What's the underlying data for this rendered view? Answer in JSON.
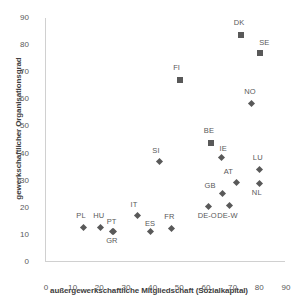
{
  "chart_data": {
    "type": "scatter",
    "title": "",
    "xlabel": "außergewerkschaftliche Mitgliedschaft (Sozialkapital)",
    "ylabel": "gewerkschaftlicher Organisationsgrad",
    "xlim": [
      0,
      90
    ],
    "ylim": [
      0,
      90
    ],
    "xticks": [
      "0",
      "10",
      "20",
      "30",
      "40",
      "50",
      "60",
      "70",
      "80",
      "90"
    ],
    "yticks": [
      "0",
      "10",
      "20",
      "30",
      "40",
      "50",
      "60",
      "70",
      "80",
      "90"
    ],
    "grid": false,
    "legend": "none",
    "marker_color": "#595959",
    "points": [
      {
        "label": "PL",
        "x": 14.0,
        "y": 12.8,
        "marker": "diamond",
        "label_dx": -1,
        "label_dy": -13
      },
      {
        "label": "HU",
        "x": 20.3,
        "y": 12.8,
        "marker": "diamond",
        "label_dx": -1,
        "label_dy": -13
      },
      {
        "label": "PT",
        "x": 24.8,
        "y": 11.4,
        "marker": "diamond",
        "label_dx": 0.5,
        "label_dy": -11
      },
      {
        "label": "GR",
        "x": 25.2,
        "y": 11.2,
        "marker": "diamond",
        "label_dx": -1,
        "label_dy": 7
      },
      {
        "label": "IT",
        "x": 34.3,
        "y": 17.0,
        "marker": "diamond",
        "label_dx": -1,
        "label_dy": -13
      },
      {
        "label": "ES",
        "x": 39.0,
        "y": 11.1,
        "marker": "diamond",
        "label_dx": 1,
        "label_dy": -10
      },
      {
        "label": "FR",
        "x": 47.0,
        "y": 12.4,
        "marker": "diamond",
        "label_dx": -1,
        "label_dy": -13
      },
      {
        "label": "SI",
        "x": 42.5,
        "y": 37.0,
        "marker": "diamond",
        "label_dx": -1,
        "label_dy": -13
      },
      {
        "label": "FI",
        "x": 50.3,
        "y": 67.0,
        "marker": "square",
        "label_dx": -1,
        "label_dy": -14
      },
      {
        "label": "DK",
        "x": 73.0,
        "y": 83.8,
        "marker": "square",
        "label_dx": -1,
        "label_dy": -14
      },
      {
        "label": "SE",
        "x": 80.3,
        "y": 77.2,
        "marker": "square",
        "label_dx": 5,
        "label_dy": -12
      },
      {
        "label": "NO",
        "x": 77.0,
        "y": 58.5,
        "marker": "diamond",
        "label_dx": -1,
        "label_dy": -13
      },
      {
        "label": "BE",
        "x": 61.8,
        "y": 44.0,
        "marker": "square",
        "label_dx": -1,
        "label_dy": -14
      },
      {
        "label": "IE",
        "x": 65.8,
        "y": 38.5,
        "marker": "diamond",
        "label_dx": 4,
        "label_dy": -11
      },
      {
        "label": "LU",
        "x": 80.2,
        "y": 34.2,
        "marker": "diamond",
        "label_dx": -1,
        "label_dy": -13
      },
      {
        "label": "AT",
        "x": 71.5,
        "y": 29.5,
        "marker": "diamond",
        "label_dx": -7,
        "label_dy": -12
      },
      {
        "label": "NL",
        "x": 80.2,
        "y": 28.9,
        "marker": "diamond",
        "label_dx": -2,
        "label_dy": 7
      },
      {
        "label": "GB",
        "x": 66.2,
        "y": 25.4,
        "marker": "diamond",
        "label_dx": -12,
        "label_dy": -9
      },
      {
        "label": "DE-O",
        "x": 61.0,
        "y": 20.6,
        "marker": "diamond",
        "label_dx": -5,
        "label_dy": 8
      },
      {
        "label": "DE-W",
        "x": 68.7,
        "y": 21.0,
        "marker": "diamond",
        "label_dx": -6,
        "label_dy": 9
      }
    ]
  }
}
